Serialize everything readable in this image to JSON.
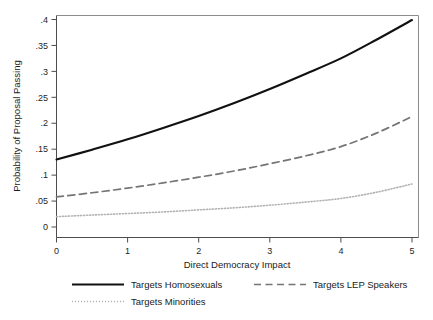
{
  "chart_data": {
    "type": "line",
    "title": "",
    "xlabel": "Direct Democracy Impact",
    "ylabel": "Probability of Proposal Passing",
    "xlim": [
      0,
      5
    ],
    "ylim": [
      0,
      0.41
    ],
    "grid": false,
    "legend_position": "bottom",
    "x_ticks": [
      "0",
      "1",
      "2",
      "3",
      "4",
      "5"
    ],
    "x_tick_values": [
      0,
      1,
      2,
      3,
      4,
      5
    ],
    "y_ticks": [
      "0",
      ".05",
      ".1",
      ".15",
      ".2",
      ".25",
      ".3",
      ".35",
      ".4"
    ],
    "y_tick_values": [
      0,
      0.05,
      0.1,
      0.15,
      0.2,
      0.25,
      0.3,
      0.35,
      0.4
    ],
    "x": [
      0,
      0.5,
      1,
      1.5,
      2,
      2.5,
      3,
      3.5,
      4,
      4.5,
      5
    ],
    "series": [
      {
        "name": "Targets Homosexuals",
        "style": "solid",
        "color": "#111111",
        "values": [
          0.13,
          0.149,
          0.169,
          0.191,
          0.214,
          0.239,
          0.266,
          0.295,
          0.325,
          0.361,
          0.399
        ]
      },
      {
        "name": "Targets LEP Speakers",
        "style": "dashed",
        "color": "#757575",
        "values": [
          0.058,
          0.066,
          0.075,
          0.085,
          0.096,
          0.108,
          0.122,
          0.137,
          0.155,
          0.181,
          0.213
        ]
      },
      {
        "name": "Targets Minorities",
        "style": "dotted",
        "color": "#b3b3b3",
        "values": [
          0.02,
          0.023,
          0.026,
          0.029,
          0.033,
          0.037,
          0.042,
          0.048,
          0.055,
          0.067,
          0.083
        ]
      }
    ]
  },
  "legend": {
    "entries": [
      {
        "label": "Targets Homosexuals"
      },
      {
        "label": "Targets LEP Speakers"
      },
      {
        "label": "Targets Minorities"
      }
    ]
  },
  "axes": {
    "x_title": "Direct Democracy Impact",
    "y_title": "Probability of Proposal Passing"
  }
}
